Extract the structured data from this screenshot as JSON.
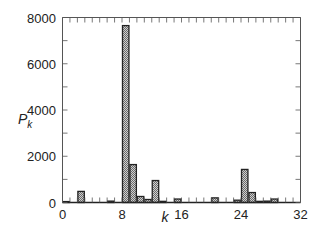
{
  "chart_data": {
    "type": "bar",
    "title": "",
    "xlabel": "k",
    "ylabel": "P_k",
    "ylabel_main": "P",
    "ylabel_sub": "k",
    "xlim": [
      0,
      32
    ],
    "ylim": [
      0,
      8000
    ],
    "x_ticks": [
      "0",
      "8",
      "16",
      "24",
      "32"
    ],
    "y_ticks": [
      "0",
      "2000",
      "4000",
      "6000",
      "8000"
    ],
    "grid": false,
    "legend": null,
    "categories": [
      0,
      1,
      2,
      3,
      4,
      5,
      6,
      7,
      8,
      9,
      10,
      11,
      12,
      13,
      14,
      15,
      16,
      17,
      18,
      19,
      20,
      21,
      22,
      23,
      24,
      25,
      26,
      27,
      28,
      29,
      30,
      31
    ],
    "values": [
      40,
      0,
      480,
      0,
      0,
      0,
      60,
      0,
      7650,
      1640,
      260,
      130,
      950,
      50,
      0,
      150,
      0,
      0,
      0,
      0,
      200,
      0,
      0,
      100,
      1430,
      430,
      50,
      60,
      150,
      0,
      0,
      0
    ]
  }
}
